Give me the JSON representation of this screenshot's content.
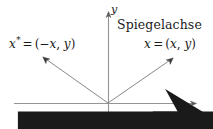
{
  "figure": {
    "title_caption": "Spiegelachse",
    "background_color": "#ffffff",
    "width": 213,
    "height": 129
  },
  "axes": {
    "y_label": "y",
    "x_label": "x",
    "axis_color": "#8f8f8f",
    "origin": {
      "x": 108,
      "y": 103
    },
    "x_axis": {
      "x1": 14,
      "y1": 103,
      "x2": 196,
      "y2": 103
    },
    "y_axis": {
      "x1": 108,
      "y1": 12,
      "x2": 108,
      "y2": 124
    }
  },
  "vectors": [
    {
      "name": "mirrored-vector",
      "symbol": "x",
      "superscript": "*",
      "equals": "=",
      "open_paren": "(",
      "minus": "−",
      "component_x": "x",
      "comma": ",",
      "component_y": "y",
      "close_paren": ")",
      "from": {
        "x": 108,
        "y": 103
      },
      "to": {
        "x": 43,
        "y": 57
      },
      "color": "#6e6e6e"
    },
    {
      "name": "vector",
      "symbol": "x",
      "superscript": "",
      "equals": "=",
      "open_paren": "(",
      "minus": "",
      "component_x": "x",
      "comma": ",",
      "component_y": "y",
      "close_paren": ")",
      "from": {
        "x": 108,
        "y": 103
      },
      "to": {
        "x": 173,
        "y": 58
      },
      "color": "#6e6e6e"
    }
  ]
}
